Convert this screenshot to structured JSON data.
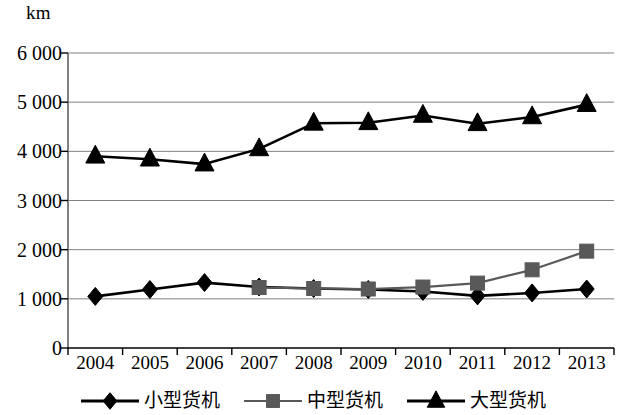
{
  "chart_data": {
    "type": "line",
    "title": "",
    "subtitle": "",
    "xlabel": "",
    "ylabel": "km",
    "unit_label": "km",
    "categories": [
      "2004",
      "2005",
      "2006",
      "2007",
      "2008",
      "2009",
      "2010",
      "2011",
      "2012",
      "2013"
    ],
    "ylim": [
      0,
      6000
    ],
    "ytick_values": [
      0,
      1000,
      2000,
      3000,
      4000,
      5000,
      6000
    ],
    "ytick_labels": [
      "0",
      "1 000",
      "2 000",
      "3 000",
      "4 000",
      "5 000",
      "6 000"
    ],
    "grid": "horizontal",
    "legend_position": "bottom",
    "series": [
      {
        "name": "小型货机",
        "marker": "diamond",
        "color": "#000000",
        "values": [
          1050,
          1190,
          1330,
          1240,
          1210,
          1190,
          1150,
          1060,
          1120,
          1200
        ]
      },
      {
        "name": "中型货机",
        "marker": "square",
        "color": "#595959",
        "values": [
          null,
          null,
          null,
          1230,
          1210,
          1200,
          1240,
          1320,
          1590,
          1970
        ]
      },
      {
        "name": "大型货机",
        "marker": "triangle",
        "color": "#000000",
        "values": [
          3900,
          3840,
          3740,
          4050,
          4570,
          4580,
          4730,
          4560,
          4700,
          4950
        ]
      }
    ]
  },
  "legend": {
    "items": [
      {
        "label": "小型货机",
        "marker": "diamond",
        "color": "#000000"
      },
      {
        "label": "中型货机",
        "marker": "square",
        "color": "#595959"
      },
      {
        "label": "大型货机",
        "marker": "triangle",
        "color": "#000000"
      }
    ]
  },
  "colors": {
    "axis": "#000000",
    "grid": "#808080",
    "small_series": "#000000",
    "medium_series": "#595959",
    "large_series": "#000000",
    "background": "#ffffff"
  }
}
